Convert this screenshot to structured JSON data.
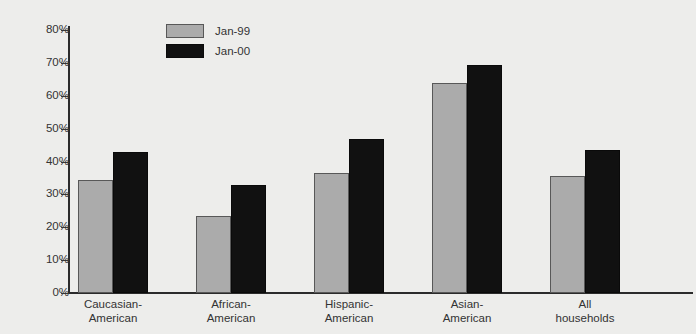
{
  "chart_data": {
    "type": "bar",
    "title": "",
    "xlabel": "",
    "ylabel": "",
    "ylim": [
      0,
      80
    ],
    "ytick_labels": [
      "80%",
      "70%",
      "60%",
      "50%",
      "40%",
      "30%",
      "20%",
      "10%",
      "0%"
    ],
    "ytick_values": [
      80,
      70,
      60,
      50,
      40,
      30,
      20,
      10,
      0
    ],
    "grid": false,
    "legend_position": "top-left-inside",
    "categories": [
      "Caucasian-\nAmerican",
      "African-\nAmerican",
      "Hispanic-\nAmerican",
      "Asian-\nAmerican",
      "All\nhouseholds"
    ],
    "series": [
      {
        "name": "Jan-99",
        "color": "#ababab",
        "values": [
          34.5,
          23.5,
          36.5,
          64.0,
          35.5
        ]
      },
      {
        "name": "Jan-00",
        "color": "#111111",
        "values": [
          43.0,
          33.0,
          47.0,
          69.5,
          43.5
        ]
      }
    ]
  },
  "legend": {
    "items": [
      {
        "label": "Jan-99",
        "swatch": "gray"
      },
      {
        "label": "Jan-00",
        "swatch": "black"
      }
    ]
  },
  "axis": {
    "y_ticks": [
      {
        "label": "80%",
        "value": 80
      },
      {
        "label": "70%",
        "value": 70
      },
      {
        "label": "60%",
        "value": 60
      },
      {
        "label": "50%",
        "value": 50
      },
      {
        "label": "40%",
        "value": 40
      },
      {
        "label": "30%",
        "value": 30
      },
      {
        "label": "20%",
        "value": 20
      },
      {
        "label": "10%",
        "value": 10
      },
      {
        "label": "0%",
        "value": 0
      }
    ]
  },
  "colors": {
    "background": "#ededeb",
    "axis": "#2b2b2b",
    "text": "#333333",
    "series_1": "#ababab",
    "series_2": "#111111"
  }
}
